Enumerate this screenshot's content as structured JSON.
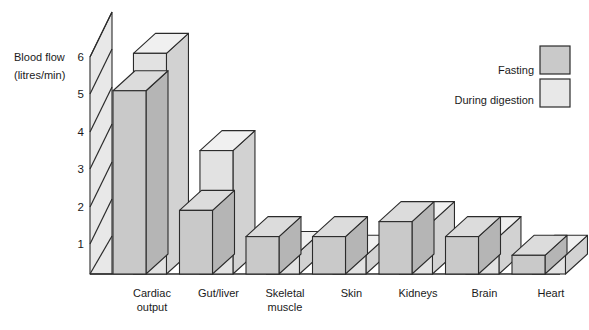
{
  "chart_data": {
    "type": "bar",
    "title": "",
    "subtitle": "",
    "xlabel": "",
    "ylabel": "Blood flow (litres/min)",
    "ylabel_line1": "Blood flow",
    "ylabel_line2": "(litres/min)",
    "ylim": [
      0,
      6
    ],
    "yticks": [
      1,
      2,
      3,
      4,
      5,
      6
    ],
    "ytick_labels": [
      "1",
      "2",
      "3",
      "4",
      "5",
      "6"
    ],
    "grid": true,
    "grid_style": "diagonal-hatched-axis-wall",
    "render_style": "3d-isometric-bars",
    "legend_position": "top-right",
    "categories": [
      "Cardiac output",
      "Gut/liver",
      "Skeletal muscle",
      "Skin",
      "Kidneys",
      "Brain",
      "Heart"
    ],
    "category_label_lines": [
      [
        "Cardiac",
        "output"
      ],
      [
        "Gut/liver"
      ],
      [
        "Skeletal",
        "muscle"
      ],
      [
        "Skin"
      ],
      [
        "Kidneys"
      ],
      [
        "Brain"
      ],
      [
        "Heart"
      ]
    ],
    "series": [
      {
        "name": "Fasting",
        "color": "#c9c9c9",
        "values": [
          4.9,
          1.7,
          1.0,
          1.0,
          1.4,
          1.0,
          0.5
        ]
      },
      {
        "name": "During digestion",
        "color": "#e2e2e2",
        "values": [
          5.9,
          3.3,
          0.6,
          0.5,
          1.4,
          1.0,
          0.5
        ]
      }
    ]
  },
  "legend": {
    "items": [
      {
        "label": "Fasting",
        "color": "#c9c9c9"
      },
      {
        "label": "During digestion",
        "color": "#e8e8e8"
      }
    ]
  },
  "colors": {
    "bar_front_dark": "#c9c9c9",
    "bar_front_light": "#e2e2e2",
    "bar_top_dark": "#dcdcdc",
    "bar_top_light": "#f0f0f0",
    "bar_side_dark": "#b5b5b5",
    "bar_side_light": "#d2d2d2",
    "axis_wall": "#e8e8e8",
    "outline": "#2b2b2b",
    "text": "#1a1a1a"
  }
}
